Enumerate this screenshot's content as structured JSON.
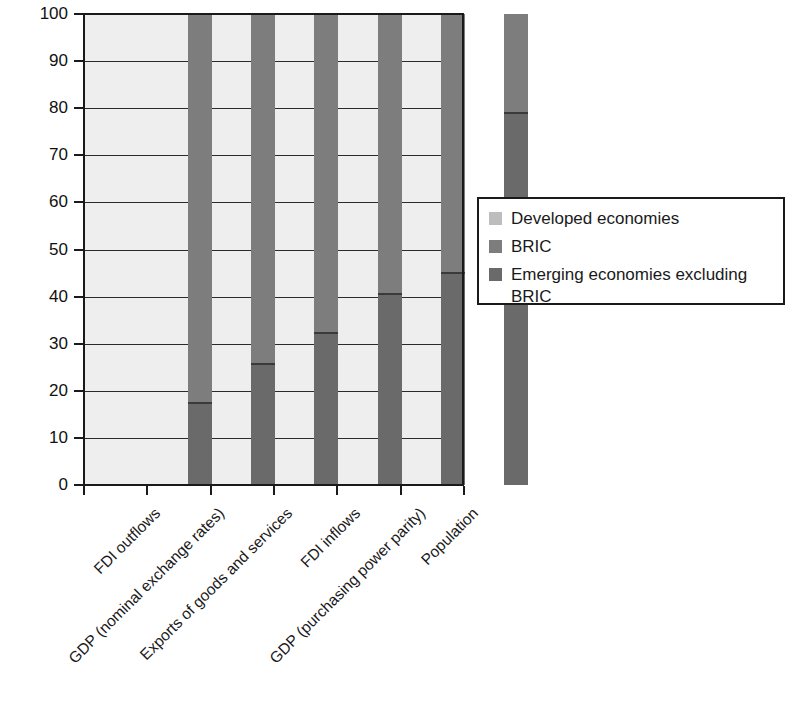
{
  "chart_data": {
    "type": "bar",
    "subtype": "100% stacked bar",
    "title": "",
    "xlabel": "",
    "ylabel": "",
    "ylim": [
      0,
      100
    ],
    "yticks": [
      0,
      10,
      20,
      30,
      40,
      50,
      60,
      70,
      80,
      90,
      100
    ],
    "grid": true,
    "grid_axis": "y",
    "legend_position": "right",
    "categories": [
      "FDI outflows",
      "GDP (nominal exchange rates)",
      "Exports of goods and services",
      "FDI inflows",
      "GDP (purchasing power parity)",
      "Population"
    ],
    "series": [
      {
        "name": "Emerging economies excluding BRIC",
        "color": "#6a6a6a",
        "values": [
          17.6,
          26.0,
          32.5,
          40.7,
          45.2,
          79.2
        ]
      },
      {
        "name": "BRIC",
        "color": "#7d7d7d",
        "values": [
          82.4,
          74.0,
          67.5,
          59.3,
          54.8,
          20.8
        ]
      },
      {
        "name": "Developed economies",
        "color": "#bdbdbd",
        "values": [
          0,
          0,
          0,
          0,
          0,
          0
        ]
      }
    ],
    "bar_totals": [
      100,
      100,
      100,
      100,
      100,
      100
    ],
    "segment_boundaries": [
      17.6,
      26.0,
      32.5,
      40.7,
      45.2,
      79.2
    ]
  },
  "axis": {
    "y_tick_labels": [
      "0",
      "10",
      "20",
      "30",
      "40",
      "50",
      "60",
      "70",
      "80",
      "90",
      "100"
    ],
    "x_tick_labels": [
      "FDI outflows",
      "GDP (nominal exchange rates)",
      "Exports of goods and services",
      "FDI inflows",
      "GDP (purchasing power parity)",
      "Population"
    ]
  },
  "legend": {
    "entries": [
      {
        "label": "Developed economies",
        "label_line2": "",
        "color": "#bdbdbd"
      },
      {
        "label": "BRIC",
        "label_line2": "",
        "color": "#7d7d7d"
      },
      {
        "label": "Emerging economies excluding",
        "label_line2": "BRIC",
        "color": "#6a6a6a"
      }
    ]
  },
  "colors": {
    "plot_background": "#eeeeee",
    "axis": "#1a1a1a",
    "gridline": "#2b2b2b",
    "developed": "#bdbdbd",
    "bric": "#7d7d7d",
    "emerging": "#6a6a6a"
  }
}
